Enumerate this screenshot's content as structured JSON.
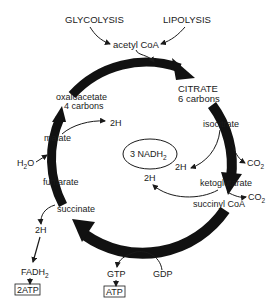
{
  "diagram": {
    "inputs": [
      {
        "id": "glycolysis",
        "label": "GLYCOLYSIS"
      },
      {
        "id": "lipolysis",
        "label": "LIPOLYSIS"
      }
    ],
    "entry": {
      "label": "acetyl CoA"
    },
    "nodes": [
      {
        "id": "citrate",
        "line1": "CITRATE",
        "line2": "6 carbons"
      },
      {
        "id": "isocitrate",
        "label": "isocitrate"
      },
      {
        "id": "ketoglutarate",
        "label": "ketoglutarate"
      },
      {
        "id": "succinyl_coa",
        "label": "succinyl CoA"
      },
      {
        "id": "succinate",
        "label": "succinate"
      },
      {
        "id": "fumarate",
        "label": "fumarate"
      },
      {
        "id": "malate",
        "label": "malate"
      },
      {
        "id": "oxaloacetate",
        "line1": "oxaloacetate",
        "line2": "4 carbons"
      }
    ],
    "center": {
      "label": "3 NADH",
      "subscript": "2"
    },
    "side_products": {
      "isocitrate_2h": "2H",
      "isocitrate_co2": "CO",
      "isocitrate_co2_sub": "2",
      "keto_2h": "2H",
      "keto_co2": "CO",
      "keto_co2_sub": "2",
      "malate_2h": "2H",
      "h2o": "H",
      "h2o_sub": "2",
      "h2o_tail": "O",
      "succinate_2h": "2H",
      "fadh": "FADH",
      "fadh_sub": "2",
      "fadh_atp": "2ATP",
      "gtp": "GTP",
      "gdp": "GDP",
      "gtp_atp": "ATP"
    },
    "colors": {
      "ink": "#1a1a1a",
      "background": "#ffffff"
    }
  }
}
